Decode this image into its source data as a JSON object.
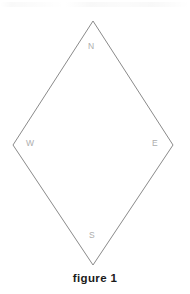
{
  "figure": {
    "caption": "figure 1",
    "background_color": "#ffffff",
    "stroke_color": "#8a8a8a",
    "label_color": "#adadad",
    "caption_color": "#1a1a1a",
    "shape": {
      "kind": "rhombus",
      "name": "diamond-outline",
      "stroke_width": 1,
      "fill": "none",
      "vertices": [
        {
          "id": "north",
          "label": "N",
          "x": 93,
          "y": 21
        },
        {
          "id": "east",
          "label": "E",
          "x": 173,
          "y": 145
        },
        {
          "id": "south",
          "label": "S",
          "x": 93,
          "y": 265
        },
        {
          "id": "west",
          "label": "W",
          "x": 13,
          "y": 145
        }
      ],
      "points_attr": "93,21 173,145 93,265 13,145"
    },
    "labels": {
      "north": "N",
      "east": "E",
      "south": "S",
      "west": "W"
    }
  }
}
